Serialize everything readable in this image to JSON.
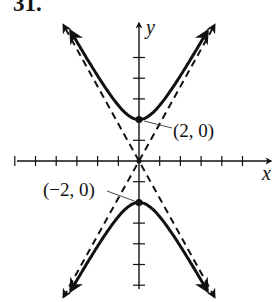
{
  "problem_number": "31.",
  "chart_data": {
    "type": "line",
    "title": "",
    "xlabel": "x",
    "ylabel": "y",
    "grid": false,
    "xlim": [
      -6,
      6
    ],
    "ylim": [
      -6,
      6
    ],
    "x_ticks": [
      -6,
      -5,
      -4,
      -3,
      -2,
      -1,
      1,
      2,
      3,
      4,
      5
    ],
    "y_ticks": [
      -6,
      -5,
      -4,
      -3,
      -2,
      -1,
      1,
      2,
      3,
      4,
      5
    ],
    "series": [
      {
        "name": "hyperbola upper branch",
        "style": "solid",
        "equation": "y^2/4 - x^2/1.23 = 1, y>0",
        "vertex": [
          0,
          2
        ]
      },
      {
        "name": "hyperbola lower branch",
        "style": "solid",
        "equation": "y^2/4 - x^2/1.23 = 1, y<0",
        "vertex": [
          0,
          -2
        ]
      },
      {
        "name": "asymptote 1",
        "style": "dashed",
        "equation": "y = 1.8x"
      },
      {
        "name": "asymptote 2",
        "style": "dashed",
        "equation": "y = -1.8x"
      }
    ],
    "annotations": [
      {
        "text": "(2, 0)",
        "points_to": [
          0,
          2
        ]
      },
      {
        "text": "(−2, 0)",
        "points_to": [
          0,
          -2
        ]
      }
    ]
  },
  "labels": {
    "upper_vertex": "(2, 0)",
    "lower_vertex": "(−2, 0)",
    "x_axis": "x",
    "y_axis": "y"
  }
}
